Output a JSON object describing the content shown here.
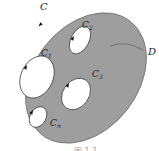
{
  "diagram": {
    "type": "multiply-connected-region",
    "colors": {
      "region_fill": "#9e9e9e",
      "region_stroke": "#6f6f6f",
      "hole_fill": "#ffffff",
      "hole_stroke": "#333333",
      "arrow": "#111111",
      "leader": "#555555",
      "text": "#222222"
    },
    "outer_boundary": {
      "label": "C",
      "cx": 86,
      "cy": 78,
      "rx": 52,
      "ry": 72,
      "rotate": 38,
      "arrow": {
        "x": 40,
        "y": 25
      }
    },
    "region": {
      "label": "D",
      "label_x": 148,
      "label_y": 55,
      "leader": {
        "x1": 110,
        "y1": 46,
        "x2": 143,
        "y2": 50
      }
    },
    "holes": [
      {
        "id": "C1",
        "label": "C",
        "sub": "1",
        "label_x": 41,
        "label_y": 56,
        "cx": 37,
        "cy": 77,
        "rx": 16,
        "ry": 22,
        "rotate": 25,
        "arrow": {
          "x": 26,
          "y": 67
        }
      },
      {
        "id": "C2",
        "label": "C",
        "sub": "2",
        "label_x": 82,
        "label_y": 28,
        "cx": 80,
        "cy": 40,
        "rx": 9,
        "ry": 15,
        "rotate": 28,
        "arrow": {
          "x": 73,
          "y": 38
        }
      },
      {
        "id": "C3",
        "label": "C",
        "sub": "3",
        "label_x": 92,
        "label_y": 77,
        "cx": 76,
        "cy": 94,
        "rx": 13,
        "ry": 17,
        "rotate": 35,
        "arrow": {
          "x": 68,
          "y": 85
        }
      },
      {
        "id": "Cn",
        "label": "C",
        "sub": "n",
        "label_x": 50,
        "label_y": 126,
        "cx": 38,
        "cy": 117,
        "rx": 8,
        "ry": 11,
        "rotate": 30,
        "arrow": {
          "x": 32,
          "y": 112
        }
      }
    ],
    "caption": "图 1.1"
  }
}
